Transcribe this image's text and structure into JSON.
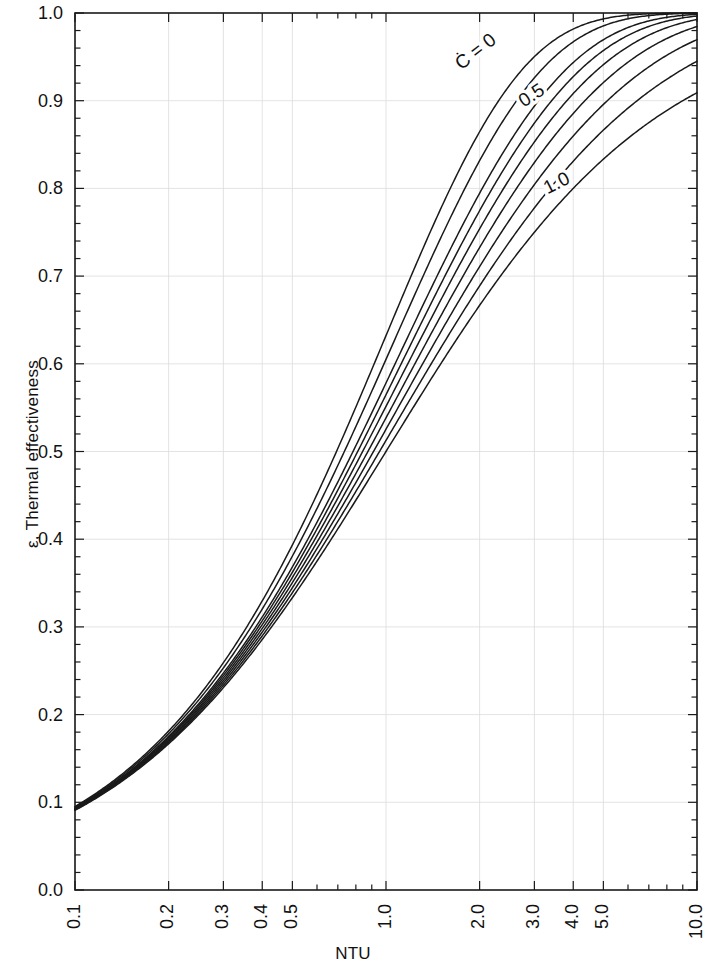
{
  "chart_data": {
    "type": "line",
    "title": "",
    "xlabel": "NTU",
    "ylabel": "ε, Thermal effectiveness",
    "xscale": "log",
    "yscale": "linear",
    "xlim": [
      0.1,
      10.0
    ],
    "ylim": [
      0.0,
      1.0
    ],
    "grid": true,
    "legend_position": "inline-curve-labels",
    "x_ticks": [
      "0.1",
      "0.2",
      "0.3",
      "0.4",
      "0.5",
      "1.0",
      "2.0",
      "3.0",
      "4.0",
      "5.0",
      "10.0"
    ],
    "x_tick_values": [
      0.1,
      0.2,
      0.3,
      0.4,
      0.5,
      1.0,
      2.0,
      3.0,
      4.0,
      5.0,
      10.0
    ],
    "y_ticks": [
      "0.0",
      "0.1",
      "0.2",
      "0.3",
      "0.4",
      "0.5",
      "0.6",
      "0.7",
      "0.8",
      "0.9",
      "1.0"
    ],
    "y_tick_values": [
      0.0,
      0.1,
      0.2,
      0.3,
      0.4,
      0.5,
      0.6,
      0.7,
      0.8,
      0.9,
      1.0
    ],
    "curve_labels": [
      {
        "text": "Ċ = 0",
        "x": 1.95,
        "y": 0.955,
        "rotation": -38
      },
      {
        "text": "0.5",
        "x": 2.95,
        "y": 0.905,
        "rotation": -33
      },
      {
        "text": "1.0",
        "x": 3.55,
        "y": 0.805,
        "rotation": -27
      }
    ],
    "x": [
      0.1,
      0.12,
      0.15,
      0.18,
      0.2,
      0.25,
      0.3,
      0.35,
      0.4,
      0.5,
      0.6,
      0.7,
      0.8,
      0.9,
      1.0,
      1.2,
      1.4,
      1.6,
      1.8,
      2.0,
      2.5,
      3.0,
      3.5,
      4.0,
      5.0,
      6.0,
      7.0,
      8.0,
      9.0,
      10.0
    ],
    "series": [
      {
        "name": "C* = 0",
        "cstar": 0.0,
        "values": [
          0.095,
          0.113,
          0.139,
          0.165,
          0.181,
          0.221,
          0.259,
          0.295,
          0.33,
          0.393,
          0.451,
          0.503,
          0.551,
          0.593,
          0.632,
          0.699,
          0.753,
          0.798,
          0.835,
          0.865,
          0.918,
          0.95,
          0.97,
          0.982,
          0.993,
          0.998,
          0.999,
          1.0,
          1.0,
          1.0
        ]
      },
      {
        "name": "C* = 0.2",
        "cstar": 0.2,
        "values": [
          0.094,
          0.111,
          0.136,
          0.161,
          0.177,
          0.215,
          0.251,
          0.285,
          0.318,
          0.378,
          0.432,
          0.481,
          0.526,
          0.566,
          0.603,
          0.666,
          0.718,
          0.762,
          0.798,
          0.828,
          0.884,
          0.921,
          0.946,
          0.963,
          0.983,
          0.992,
          0.996,
          0.998,
          0.999,
          1.0
        ]
      },
      {
        "name": "C* = 0.4",
        "cstar": 0.4,
        "values": [
          0.094,
          0.11,
          0.134,
          0.157,
          0.173,
          0.209,
          0.243,
          0.275,
          0.306,
          0.363,
          0.413,
          0.459,
          0.501,
          0.539,
          0.574,
          0.634,
          0.684,
          0.726,
          0.762,
          0.792,
          0.848,
          0.888,
          0.917,
          0.938,
          0.965,
          0.98,
          0.989,
          0.993,
          0.996,
          0.998
        ]
      },
      {
        "name": "C* = 0.5",
        "cstar": 0.5,
        "values": [
          0.094,
          0.109,
          0.132,
          0.155,
          0.17,
          0.205,
          0.238,
          0.27,
          0.299,
          0.355,
          0.404,
          0.448,
          0.489,
          0.526,
          0.56,
          0.618,
          0.667,
          0.709,
          0.744,
          0.775,
          0.831,
          0.872,
          0.902,
          0.925,
          0.955,
          0.973,
          0.983,
          0.99,
          0.994,
          0.996
        ]
      },
      {
        "name": "C* = 0.6",
        "cstar": 0.6,
        "values": [
          0.093,
          0.109,
          0.131,
          0.154,
          0.168,
          0.202,
          0.235,
          0.265,
          0.294,
          0.348,
          0.395,
          0.438,
          0.478,
          0.514,
          0.547,
          0.603,
          0.651,
          0.692,
          0.727,
          0.757,
          0.814,
          0.856,
          0.887,
          0.911,
          0.944,
          0.964,
          0.977,
          0.985,
          0.991,
          0.994
        ]
      },
      {
        "name": "C* = 0.7",
        "cstar": 0.7,
        "values": [
          0.093,
          0.108,
          0.13,
          0.152,
          0.166,
          0.199,
          0.231,
          0.261,
          0.288,
          0.341,
          0.387,
          0.429,
          0.467,
          0.502,
          0.534,
          0.589,
          0.636,
          0.676,
          0.71,
          0.74,
          0.797,
          0.84,
          0.872,
          0.897,
          0.932,
          0.955,
          0.97,
          0.98,
          0.986,
          0.991
        ]
      },
      {
        "name": "C* = 0.8",
        "cstar": 0.8,
        "values": [
          0.093,
          0.108,
          0.129,
          0.15,
          0.164,
          0.196,
          0.227,
          0.256,
          0.283,
          0.334,
          0.379,
          0.419,
          0.456,
          0.49,
          0.521,
          0.575,
          0.621,
          0.66,
          0.694,
          0.724,
          0.781,
          0.824,
          0.857,
          0.883,
          0.921,
          0.945,
          0.962,
          0.974,
          0.982,
          0.987
        ]
      },
      {
        "name": "C* = 0.9",
        "cstar": 0.9,
        "values": [
          0.092,
          0.107,
          0.128,
          0.148,
          0.162,
          0.193,
          0.223,
          0.251,
          0.278,
          0.327,
          0.371,
          0.41,
          0.446,
          0.479,
          0.509,
          0.562,
          0.607,
          0.645,
          0.679,
          0.708,
          0.765,
          0.809,
          0.843,
          0.87,
          0.909,
          0.936,
          0.954,
          0.967,
          0.976,
          0.983
        ]
      },
      {
        "name": "C* = 1.0",
        "cstar": 1.0,
        "values": [
          0.091,
          0.107,
          0.13,
          0.153,
          0.167,
          0.2,
          0.231,
          0.259,
          0.286,
          0.333,
          0.375,
          0.412,
          0.444,
          0.474,
          0.5,
          0.545,
          0.583,
          0.615,
          0.643,
          0.667,
          0.714,
          0.75,
          0.778,
          0.8,
          0.833,
          0.857,
          0.875,
          0.889,
          0.9,
          0.909
        ]
      }
    ]
  },
  "axes": {
    "x_title": "NTU",
    "y_title": "ε, Thermal effectiveness"
  },
  "style": {
    "line_color": "#1a1a1a",
    "axis_color": "#1a1a1a",
    "grid_color": "#dcdcdc",
    "background": "#ffffff"
  }
}
